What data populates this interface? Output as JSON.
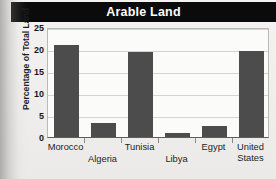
{
  "figure": {
    "title": "Arable Land",
    "title_band_color": "#0b0b0b",
    "title_text_color": "#ffffff",
    "background_color": "#f2f1ef",
    "plot_background_color": "#fbfbfa",
    "bar_color": "#4c4c4c",
    "gridline_color": "#d3d3d0"
  },
  "chart_data": {
    "type": "bar",
    "title": "Arable Land",
    "subtitle": "",
    "xlabel": "",
    "ylabel": "Percentage of Total Land",
    "categories": [
      "Morocco",
      "Algeria",
      "Tunisia",
      "Libya",
      "Egypt",
      "United States"
    ],
    "values": [
      21.0,
      3.2,
      19.3,
      1.0,
      2.4,
      19.6
    ],
    "series": [
      {
        "name": "Percentage of Total Land",
        "values": [
          21.0,
          3.2,
          19.3,
          1.0,
          2.4,
          19.6
        ]
      }
    ],
    "ylim": [
      0,
      25
    ],
    "yticks": [
      0,
      5,
      10,
      15,
      20,
      25
    ],
    "ytick_labels": [
      "0",
      "5",
      "10",
      "15",
      "20",
      "25"
    ],
    "xtick_labels_staggered": true,
    "xtick_label_rows": [
      {
        "label": "Morocco",
        "row": "top"
      },
      {
        "label": "Algeria",
        "row": "bottom"
      },
      {
        "label": "Tunisia",
        "row": "top"
      },
      {
        "label": "Libya",
        "row": "bottom"
      },
      {
        "label": "Egypt",
        "row": "top"
      },
      {
        "label": "United States",
        "row": "top",
        "wrap": [
          "United",
          "States"
        ]
      }
    ],
    "grid": true,
    "grid_axis": "y",
    "legend": false,
    "legend_position": "none",
    "bar_color": "#4c4c4c"
  }
}
